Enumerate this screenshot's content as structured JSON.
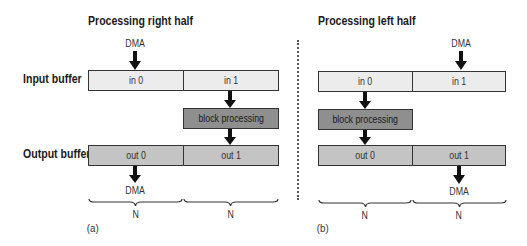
{
  "panels": [
    {
      "title": "Processing right half",
      "caption": "(a)",
      "input_cells": [
        "in 0",
        "in 1"
      ],
      "output_cells": [
        "out 0",
        "out 1"
      ],
      "processing_label": "block processing",
      "dma_in_label": "DMA",
      "dma_out_label": "DMA",
      "brace_labels": [
        "N",
        "N"
      ]
    },
    {
      "title": "Processing left half",
      "caption": "(b)",
      "input_cells": [
        "in 0",
        "in 1"
      ],
      "output_cells": [
        "out 0",
        "out 1"
      ],
      "processing_label": "block processing",
      "dma_in_label": "DMA",
      "dma_out_label": "DMA",
      "brace_labels": [
        "N",
        "N"
      ]
    }
  ],
  "row_labels": {
    "input": "Input buffer",
    "output": "Output buffer"
  },
  "colors": {
    "input_fill": "#ececec",
    "output_fill": "#c4c4c4",
    "processing_fill": "#8f8f8f",
    "stroke": "#333333"
  }
}
